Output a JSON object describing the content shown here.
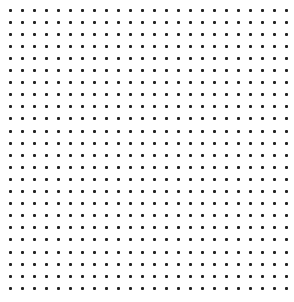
{
  "canvas": {
    "width": 294,
    "height": 302,
    "background": "#ffffff"
  },
  "dot_grid": {
    "columns": 24,
    "rows": 24,
    "origin_x": 10,
    "origin_y": 10,
    "spacing_x": 12,
    "spacing_y": 12.1,
    "dot_size": 3,
    "dot_color": "#222222"
  }
}
